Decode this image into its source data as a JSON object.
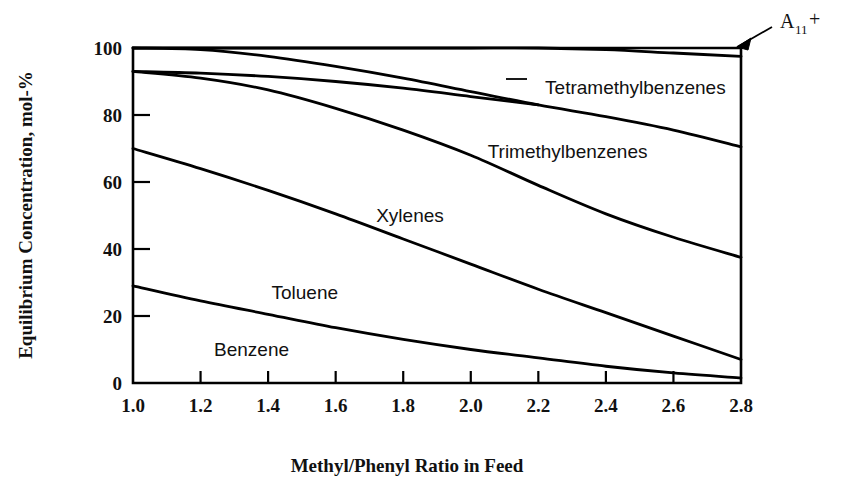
{
  "chart_data": {
    "type": "line",
    "title": "",
    "xlabel": "Methyl/Phenyl Ratio in Feed",
    "ylabel": "Equilibrium Concentration, mol-%",
    "xlim": [
      1.0,
      2.8
    ],
    "ylim": [
      0,
      100
    ],
    "grid": false,
    "legend_position": "inline-labels",
    "xticks": [
      "1.0",
      "1.2",
      "1.4",
      "1.6",
      "1.8",
      "2.0",
      "2.2",
      "2.4",
      "2.6",
      "2.8"
    ],
    "xtick_values": [
      1.0,
      1.2,
      1.4,
      1.6,
      1.8,
      2.0,
      2.2,
      2.4,
      2.6,
      2.8
    ],
    "yticks": [
      "0",
      "20",
      "40",
      "60",
      "80",
      "100"
    ],
    "ytick_values": [
      0,
      20,
      40,
      60,
      80,
      100
    ],
    "x": [
      1.0,
      1.2,
      1.4,
      1.6,
      1.8,
      2.0,
      2.2,
      2.4,
      2.6,
      2.8
    ],
    "series": [
      {
        "name": "A11+",
        "label": "A₁₁+",
        "label_text": "A",
        "label_sub": "11",
        "label_sup": "+",
        "values": [
          100,
          100,
          100,
          100,
          100,
          100,
          100,
          99.5,
          98.5,
          97.5
        ],
        "annotation": true
      },
      {
        "name": "Tetramethylbenzenes",
        "label": "Tetramethylbenzenes",
        "values": [
          93,
          92.5,
          91.5,
          90,
          88,
          85.5,
          83,
          null,
          null,
          null
        ]
      },
      {
        "name": "Trimethylbenzenes",
        "label": "Trimethylbenzenes",
        "values": [
          100,
          99.5,
          97.5,
          94.5,
          91,
          87,
          83,
          79.5,
          75.5,
          70.5
        ]
      },
      {
        "name": "Xylenes",
        "label": "Xylenes",
        "values": [
          93,
          91,
          87.5,
          82,
          75.5,
          68,
          59,
          50.5,
          43.5,
          37.5
        ]
      },
      {
        "name": "Toluene",
        "label": "Toluene",
        "values": [
          70,
          64,
          57.5,
          50.5,
          43,
          35.5,
          28,
          21,
          14,
          7
        ]
      },
      {
        "name": "Benzene",
        "label": "Benzene",
        "values": [
          29,
          24.5,
          20.5,
          16.5,
          13,
          10,
          7.5,
          5,
          3,
          1.5
        ]
      }
    ],
    "inline_label_positions": [
      {
        "label": "Tetramethylbenzenes",
        "x": 2.22,
        "y": 88
      },
      {
        "label": "Trimethylbenzenes",
        "x": 2.05,
        "y": 69
      },
      {
        "label": "Xylenes",
        "x": 1.72,
        "y": 50
      },
      {
        "label": "Toluene",
        "x": 1.41,
        "y": 27
      },
      {
        "label": "Benzene",
        "x": 1.24,
        "y": 10
      },
      {
        "label": "A11+",
        "x": 2.93,
        "y": 110
      }
    ],
    "colors": {
      "curve": "#000000",
      "axis": "#000000",
      "text": "#111111",
      "background": "#ffffff"
    }
  }
}
